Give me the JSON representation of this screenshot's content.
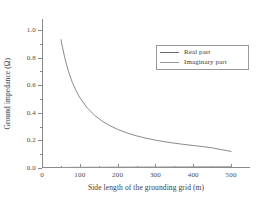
{
  "chart_data": {
    "type": "line",
    "title": "",
    "xlabel": "Side length of the grounding grid (m)",
    "ylabel": "Ground impedance (Ω)",
    "xlim": [
      0,
      550
    ],
    "ylim": [
      0.0,
      1.08
    ],
    "grid": false,
    "legend_position": "upper-right",
    "x_ticks": [
      0,
      100,
      200,
      300,
      400,
      500
    ],
    "x_tick_labels": [
      "0",
      "100",
      "200",
      "300",
      "400",
      "500"
    ],
    "x_minor_ticks": [
      50,
      150,
      250,
      350,
      450
    ],
    "y_ticks": [
      0.0,
      0.2,
      0.4,
      0.6,
      0.8,
      1.0
    ],
    "y_tick_labels": [
      "0.0",
      "0.2",
      "0.4",
      "0.6",
      "0.8",
      "1.0"
    ],
    "y_minor_ticks": [
      0.1,
      0.3,
      0.5,
      0.7,
      0.9
    ],
    "x": [
      50,
      60,
      70,
      80,
      90,
      100,
      120,
      140,
      160,
      180,
      200,
      225,
      250,
      275,
      300,
      325,
      350,
      375,
      400,
      425,
      450,
      475,
      500
    ],
    "series": [
      {
        "name": "Real part",
        "color": "#6b6b6b",
        "values": [
          0.93,
          0.8,
          0.7,
          0.622,
          0.56,
          0.51,
          0.434,
          0.38,
          0.338,
          0.306,
          0.28,
          0.254,
          0.233,
          0.216,
          0.202,
          0.19,
          0.18,
          0.171,
          0.163,
          0.155,
          0.146,
          0.133,
          0.12
        ]
      },
      {
        "name": "Imaginary part",
        "color": "#9a9a9a",
        "values": [
          0.004,
          0.004,
          0.005,
          0.005,
          0.005,
          0.005,
          0.006,
          0.006,
          0.006,
          0.007,
          0.007,
          0.007,
          0.008,
          0.008,
          0.008,
          0.009,
          0.009,
          0.009,
          0.01,
          0.01,
          0.01,
          0.011,
          0.011
        ]
      }
    ]
  },
  "legend": {
    "entries": [
      {
        "label": "Real part"
      },
      {
        "label": "Imaginary part"
      }
    ]
  }
}
